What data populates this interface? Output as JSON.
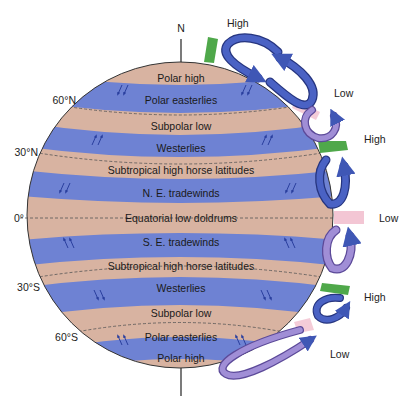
{
  "diagram": {
    "axis": {
      "north_label": "N"
    },
    "colors": {
      "tan": "#d8b3a1",
      "blue": "#6e82d3",
      "rim": "#333333",
      "cell_blue": "#3f57b5",
      "cell_purple": "#9a86cc",
      "high_bar": "#4fa84a",
      "low_bar": "#f3c6d4"
    },
    "latitude_labels": {
      "n60": "60°N",
      "n30": "30°N",
      "eq": "0°",
      "s30": "30°S",
      "s60": "60°S"
    },
    "bands": [
      {
        "label": "Polar high",
        "type": "pressure"
      },
      {
        "label": "Polar easterlies",
        "type": "wind"
      },
      {
        "label": "Subpolar low",
        "type": "pressure"
      },
      {
        "label": "Westerlies",
        "type": "wind"
      },
      {
        "label": "Subtropical high horse latitudes",
        "type": "pressure"
      },
      {
        "label": "N. E. tradewinds",
        "type": "wind"
      },
      {
        "label": "Equatorial low doldrums",
        "type": "pressure"
      },
      {
        "label": "S. E. tradewinds",
        "type": "wind"
      },
      {
        "label": "Subtropical high horse latitudes",
        "type": "pressure"
      },
      {
        "label": "Westerlies",
        "type": "wind"
      },
      {
        "label": "Subpolar low",
        "type": "pressure"
      },
      {
        "label": "Polar easterlies",
        "type": "wind"
      },
      {
        "label": "Polar high",
        "type": "pressure"
      }
    ],
    "pressure_labels": {
      "north_pole_high": "High",
      "n60_low": "Low",
      "n30_high": "High",
      "equator_low": "Low",
      "s30_high": "High",
      "s60_low": "Low"
    }
  }
}
